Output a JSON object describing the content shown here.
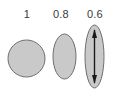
{
  "figure": {
    "background_color": "#ffffff",
    "width": 119,
    "height": 100,
    "shape_fill_color": "#c9c9c9",
    "shape_stroke_color": "#6e6e6e",
    "arrow_color": "#1a1a1a",
    "label_color": "#3a3a3a"
  },
  "chart_data": {
    "type": "diagram",
    "title": "",
    "xlabel": "",
    "ylabel": "",
    "categories": [
      "1",
      "0.8",
      "0.6"
    ],
    "values": [
      1,
      0.8,
      0.6
    ],
    "annotations": [
      "double-headed vertical arrow inside third shape"
    ],
    "legend": []
  },
  "shapes": [
    {
      "label": "1",
      "value": 1,
      "kind": "circle",
      "rx": 18.5,
      "ry": 18.5,
      "cx": 19.5,
      "cy": 19.5,
      "box_w": 39,
      "box_h": 39,
      "fill": "#c9c9c9",
      "stroke": "#6e6e6e",
      "has_arrow": false
    },
    {
      "label": "0.8",
      "value": 0.8,
      "kind": "ellipse",
      "rx": 11.5,
      "ry": 22.5,
      "cx": 12.5,
      "cy": 23.5,
      "box_w": 25,
      "box_h": 47,
      "fill": "#c9c9c9",
      "stroke": "#6e6e6e",
      "has_arrow": false
    },
    {
      "label": "0.6",
      "value": 0.6,
      "kind": "ellipse",
      "rx": 9.5,
      "ry": 31.5,
      "cx": 10.5,
      "cy": 32.5,
      "box_w": 21,
      "box_h": 65,
      "fill": "#c9c9c9",
      "stroke": "#6e6e6e",
      "has_arrow": true,
      "arrow": {
        "x": 10.5,
        "y_top": 6,
        "y_bottom": 59,
        "color": "#1a1a1a",
        "head_width": 5,
        "head_length": 8,
        "shaft_width": 1.4
      }
    }
  ]
}
